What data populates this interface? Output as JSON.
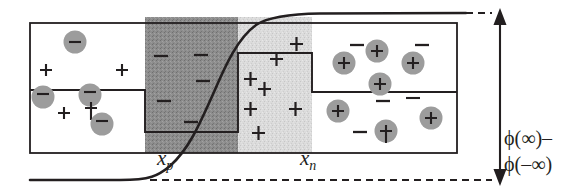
{
  "figure": {
    "type": "pn-junction-potential-diagram",
    "labels": {
      "xp": "x",
      "xp_sub": "p",
      "xn": "x",
      "xn_sub": "n",
      "phi_line1": "ϕ(∞)–",
      "phi_line2": "ϕ(–∞)"
    },
    "colors": {
      "ink": "#231f20",
      "depletion_p_fill": "#8a8a8a",
      "depletion_n_fill": "#d9d9d9",
      "neutral_fill": "#ffffff",
      "background": "#ffffff"
    },
    "regions": [
      {
        "name": "p-type-neutral",
        "x": 30,
        "width": 115,
        "fill": "#ffffff",
        "description": "neutral p region, acceptor ions shown as circled minus, free holes as plus"
      },
      {
        "name": "depletion-p-side",
        "x": 145,
        "width": 93,
        "fill": "#8a8a8a",
        "description": "negatively charged space-charge region, bare minus signs"
      },
      {
        "name": "depletion-n-side",
        "x": 238,
        "width": 74,
        "fill": "#d9d9d9",
        "description": "positively charged space-charge region, bare plus signs"
      },
      {
        "name": "n-type-neutral",
        "x": 312,
        "width": 145,
        "fill": "#ffffff",
        "description": "neutral n region, donor ions shown as circled plus, free electrons as minus"
      }
    ],
    "charges": {
      "p_region": [
        {
          "glyph": "–",
          "circled": true,
          "x": 75,
          "y": 42
        },
        {
          "glyph": "+",
          "circled": false,
          "x": 46,
          "y": 70
        },
        {
          "glyph": "+",
          "circled": false,
          "x": 122,
          "y": 70
        },
        {
          "glyph": "–",
          "circled": true,
          "x": 43,
          "y": 96
        },
        {
          "glyph": "–",
          "circled": true,
          "x": 90,
          "y": 95
        },
        {
          "glyph": "+",
          "circled": false,
          "x": 64,
          "y": 113
        },
        {
          "glyph": "+",
          "circled": false,
          "x": 91,
          "y": 108
        },
        {
          "glyph": "–",
          "circled": true,
          "x": 102,
          "y": 123
        }
      ],
      "depletion_p": [
        {
          "glyph": "–",
          "circled": false,
          "x": 160,
          "y": 55
        },
        {
          "glyph": "–",
          "circled": false,
          "x": 200,
          "y": 55
        },
        {
          "glyph": "–",
          "circled": false,
          "x": 202,
          "y": 80
        },
        {
          "glyph": "–",
          "circled": false,
          "x": 163,
          "y": 100
        },
        {
          "glyph": "–",
          "circled": false,
          "x": 190,
          "y": 122
        }
      ],
      "depletion_n": [
        {
          "glyph": "+",
          "circled": false,
          "x": 296,
          "y": 43
        },
        {
          "glyph": "+",
          "circled": false,
          "x": 276,
          "y": 58
        },
        {
          "glyph": "+",
          "circled": false,
          "x": 250,
          "y": 78
        },
        {
          "glyph": "+",
          "circled": false,
          "x": 263,
          "y": 88
        },
        {
          "glyph": "+",
          "circled": false,
          "x": 295,
          "y": 108
        },
        {
          "glyph": "+",
          "circled": false,
          "x": 250,
          "y": 108
        },
        {
          "glyph": "+",
          "circled": false,
          "x": 258,
          "y": 132
        }
      ],
      "n_region": [
        {
          "glyph": "–",
          "circled": false,
          "x": 357,
          "y": 44
        },
        {
          "glyph": "+",
          "circled": true,
          "x": 376,
          "y": 50
        },
        {
          "glyph": "–",
          "circled": false,
          "x": 422,
          "y": 44
        },
        {
          "glyph": "+",
          "circled": true,
          "x": 344,
          "y": 62
        },
        {
          "glyph": "+",
          "circled": true,
          "x": 412,
          "y": 62
        },
        {
          "glyph": "+",
          "circled": true,
          "x": 379,
          "y": 83
        },
        {
          "glyph": "+",
          "circled": true,
          "x": 337,
          "y": 110
        },
        {
          "glyph": "–",
          "circled": false,
          "x": 383,
          "y": 100
        },
        {
          "glyph": "–",
          "circled": false,
          "x": 412,
          "y": 98
        },
        {
          "glyph": "+",
          "circled": true,
          "x": 430,
          "y": 117
        },
        {
          "glyph": "–",
          "circled": false,
          "x": 360,
          "y": 131
        },
        {
          "glyph": "+",
          "circled": true,
          "x": 385,
          "y": 130
        }
      ]
    },
    "potential_curve": {
      "description": "sigmoid electrostatic potential rising from phi(-inf) on the p side to phi(+inf) on the n side",
      "baseline_y": 180,
      "plateau_y": 14
    },
    "annotation_arrow": {
      "name": "built-in-potential-arrow",
      "x": 500,
      "y_top": 14,
      "y_bottom": 180,
      "double_headed": true
    }
  }
}
